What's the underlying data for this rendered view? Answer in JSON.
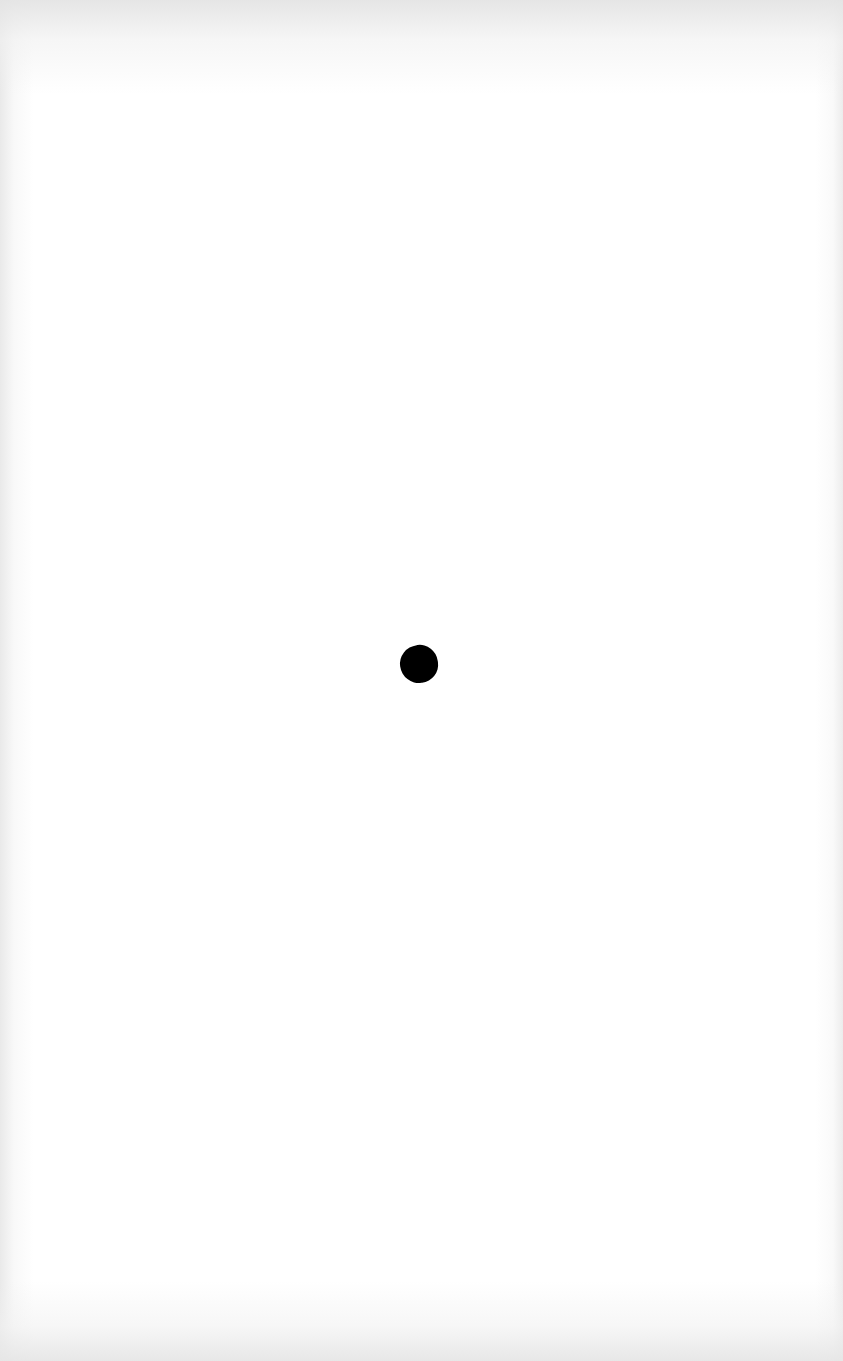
{
  "page": {
    "background_color": "#ffffff",
    "edge_shade_color": "#e6e6e6"
  },
  "mark": {
    "shape": "dot",
    "color": "#000000",
    "center_x": 419,
    "center_y": 664,
    "diameter": 38
  }
}
